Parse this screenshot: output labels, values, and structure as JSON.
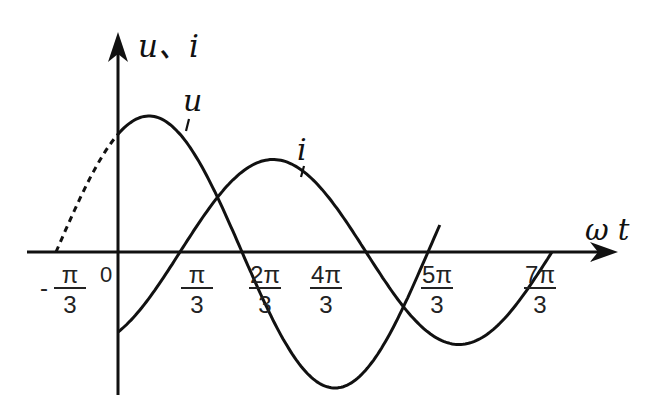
{
  "chart_data": {
    "type": "line",
    "title": "",
    "xlabel": "ω t",
    "ylabel": "u、i",
    "x_ticks": [
      {
        "label_num": "π",
        "label_den": "3",
        "prefix": "-",
        "value": "-π/3"
      },
      {
        "label_num": "",
        "label_den": "",
        "prefix": "",
        "value": "0",
        "text": "0"
      },
      {
        "label_num": "π",
        "label_den": "3",
        "prefix": "",
        "value": "π/3"
      },
      {
        "label_num": "2π",
        "label_den": "3",
        "prefix": "",
        "value": "2π/3"
      },
      {
        "label_num": "4π",
        "label_den": "3",
        "prefix": "",
        "value": "4π/3"
      },
      {
        "label_num": "5π",
        "label_den": "3",
        "prefix": "",
        "value": "5π/3"
      },
      {
        "label_num": "7π",
        "label_den": "3",
        "prefix": "",
        "value": "7π/3"
      }
    ],
    "series": [
      {
        "name": "u",
        "label": "u",
        "description": "sinusoid zero-crossing rising at -π/3 (dashed for ωt<0), peak near π/6, falls through zero near 2π/3, trough near 7π/6, rises to zero at 5π/3",
        "phase_zero": "-π/3",
        "amplitude_rel": 1.0,
        "dashed_segment": [
          "-π/3",
          "0"
        ]
      },
      {
        "name": "i",
        "label": "i",
        "description": "sinusoid starting negative at 0, rising zero-crossing at π/3, peak near 5π/6, zero at 4π/3, trough near 11π/6, zero at 7π/3",
        "phase_zero": "π/3",
        "amplitude_rel": 0.68
      }
    ],
    "legend": "none (curves labeled inline)",
    "grid": false
  },
  "labels": {
    "y_axis": "u、i",
    "x_axis": "ω t",
    "origin": "0",
    "curve_u": "u",
    "curve_i": "i"
  }
}
